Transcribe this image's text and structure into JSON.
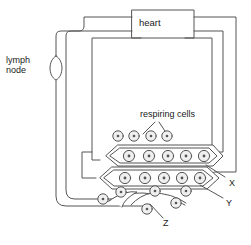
{
  "diagram": {
    "stroke_color": "#4a4a4a",
    "text_color": "#1a1a1a",
    "background": "#ffffff",
    "labels": {
      "heart": "heart",
      "lymph_node": "lymph\nnode",
      "respiring_cells": "respiring cells",
      "x": "X",
      "y": "Y",
      "z": "Z"
    },
    "structures": {
      "heart_box": "heart",
      "lymph_node_shape": "oval swelling on lymph vessel",
      "vessel_x": "upper blood capillary bed",
      "vessel_y": "lower blood capillary bed",
      "vessel_z": "blind-ended lymph capillary"
    },
    "cell_rows": {
      "top_free_row": 4,
      "upper_vessel_row": 5,
      "lower_vessel_row": 5,
      "bottom_free_cells": 6
    }
  }
}
